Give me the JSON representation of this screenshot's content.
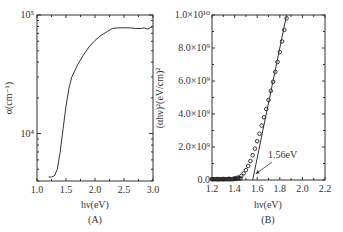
{
  "chart_data": [
    {
      "panel": "A",
      "type": "line",
      "title": "",
      "panel_label": "(A)",
      "xlabel": "hν(eV)",
      "ylabel": "α(cm⁻¹)",
      "xlim": [
        1.0,
        3.0
      ],
      "ylim_log": [
        3.6,
        5.0
      ],
      "yscale": "log",
      "xticks": [
        "1.0",
        "1.5",
        "2.0",
        "2.5",
        "3.0"
      ],
      "yticks": [
        "10⁴",
        "10⁵"
      ],
      "grid": false,
      "x": [
        1.2,
        1.25,
        1.3,
        1.35,
        1.4,
        1.45,
        1.5,
        1.55,
        1.6,
        1.7,
        1.8,
        1.9,
        2.0,
        2.1,
        2.2,
        2.3,
        2.4,
        2.5,
        2.6,
        2.7,
        2.8,
        2.85,
        2.9,
        2.95,
        3.0
      ],
      "y": [
        4300,
        4300,
        4400,
        5000,
        7000,
        11000,
        17000,
        24000,
        30000,
        38000,
        46000,
        54000,
        61000,
        67000,
        72000,
        77000,
        78000,
        78000,
        78000,
        77000,
        77000,
        78000,
        76000,
        78000,
        80000
      ]
    },
    {
      "panel": "B",
      "type": "scatter",
      "title": "",
      "panel_label": "(B)",
      "xlabel": "hν(eV)",
      "ylabel": "(αhν)²(eV/cm)²",
      "xlim": [
        1.2,
        2.2
      ],
      "ylim": [
        0,
        10000000000.0
      ],
      "xticks": [
        "1.2",
        "1.4",
        "1.6",
        "1.8",
        "2.0",
        "2.2"
      ],
      "yticks": [
        "0.0",
        "2.0×10⁹",
        "4.0×10⁹",
        "6.0×10⁹",
        "8.0×10⁹",
        "1.0×10¹⁰"
      ],
      "grid": false,
      "series": [
        {
          "name": "data",
          "marker": "open-circle",
          "x": [
            1.2,
            1.25,
            1.3,
            1.35,
            1.4,
            1.43,
            1.46,
            1.48,
            1.5,
            1.52,
            1.54,
            1.56,
            1.58,
            1.6,
            1.62,
            1.64,
            1.66,
            1.68,
            1.7,
            1.72,
            1.74,
            1.76,
            1.78,
            1.8,
            1.82,
            1.84,
            1.86
          ],
          "y": [
            50000000.0,
            50000000.0,
            60000000.0,
            70000000.0,
            100000000.0,
            150000000.0,
            250000000.0,
            400000000.0,
            600000000.0,
            850000000.0,
            1150000000.0,
            1500000000.0,
            1900000000.0,
            2350000000.0,
            2800000000.0,
            3300000000.0,
            3800000000.0,
            4300000000.0,
            4850000000.0,
            5400000000.0,
            5950000000.0,
            6550000000.0,
            7150000000.0,
            7750000000.0,
            8400000000.0,
            9100000000.0,
            9800000000.0
          ]
        },
        {
          "name": "linear fit",
          "marker": "none",
          "x": [
            1.56,
            1.86
          ],
          "y": [
            0,
            10000000000.0
          ]
        }
      ],
      "annotations": [
        {
          "text": "1.56eV",
          "x": 1.56,
          "y": 0,
          "arrow": true
        }
      ]
    }
  ]
}
